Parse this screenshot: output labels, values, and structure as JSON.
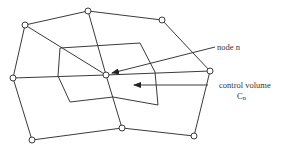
{
  "diagram": {
    "type": "finite-volume mesh with control volume",
    "labels": {
      "node": "node n",
      "control_volume_line1": "control volume",
      "control_volume_line2": "C",
      "control_volume_subscript": "n"
    },
    "colors": {
      "stroke": "#3a3a3a",
      "background": "#ffffff",
      "text": "#333333"
    },
    "nodes": [
      {
        "id": "top-left",
        "x": 25,
        "y": 25
      },
      {
        "id": "top-middle",
        "x": 88,
        "y": 11
      },
      {
        "id": "top-right",
        "x": 162,
        "y": 20
      },
      {
        "id": "right",
        "x": 210,
        "y": 71
      },
      {
        "id": "left",
        "x": 13,
        "y": 78
      },
      {
        "id": "center-n",
        "x": 106,
        "y": 75
      },
      {
        "id": "bottom-left",
        "x": 32,
        "y": 140
      },
      {
        "id": "bottom-middle",
        "x": 122,
        "y": 128
      },
      {
        "id": "bottom-right",
        "x": 194,
        "y": 136
      }
    ]
  }
}
